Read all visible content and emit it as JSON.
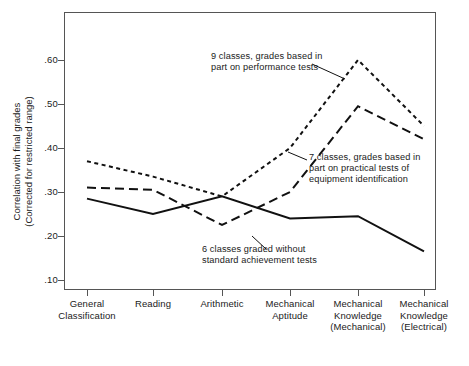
{
  "chart_data": {
    "type": "line",
    "title": "",
    "xlabel": "",
    "ylabel": "Correlation with final grades\n(Corrected for restricted range)",
    "ylabel_line1": "Correlation with final grades",
    "ylabel_line2": "(Corrected for restricted range)",
    "categories": [
      "General\nClassification",
      "Reading",
      "Arithmetic",
      "Mechanical\nAptitude",
      "Mechanical\nKnowledge\n(Mechanical)",
      "Mechanical\nKnowledge\n(Electrical)"
    ],
    "category_labels_flat": [
      "General Classification",
      "Reading",
      "Arithmetic",
      "Mechanical Aptitude",
      "Mechanical Knowledge (Mechanical)",
      "Mechanical Knowledge (Electrical)"
    ],
    "ylim": [
      0.06,
      0.655
    ],
    "yticks": [
      0.1,
      0.2,
      0.3,
      0.4,
      0.5,
      0.6
    ],
    "ytick_labels": [
      ".10",
      ".20",
      ".30",
      ".40",
      ".50",
      ".60"
    ],
    "grid": false,
    "legend": "annotations-inline",
    "series": [
      {
        "name": "9 classes, grades based in part on performance tests",
        "style": "dotted",
        "color": "#111111",
        "values": [
          0.37,
          0.335,
          0.29,
          0.4,
          0.6,
          0.45
        ]
      },
      {
        "name": "7 classes, grades based in part on practical tests of equipment identification",
        "style": "dashed",
        "color": "#111111",
        "values": [
          0.31,
          0.305,
          0.225,
          0.3,
          0.495,
          0.42
        ]
      },
      {
        "name": "6 classes graded without standard achievement tests",
        "style": "solid",
        "color": "#111111",
        "values": [
          0.285,
          0.25,
          0.29,
          0.24,
          0.245,
          0.165
        ]
      }
    ],
    "annotations": [
      {
        "id": "annotation-9-classes",
        "text": "9 classes, grades based in\npart on performance tests",
        "target_series": 0,
        "target_category_index": 4
      },
      {
        "id": "annotation-7-classes",
        "text": "7 classes, grades based in\npart on practical tests of\nequipment identification",
        "target_series": 1,
        "target_category_index": 4
      },
      {
        "id": "annotation-6-classes",
        "text": "6 classes graded without\nstandard achievement tests",
        "target_series": 2,
        "target_category_index": 3
      }
    ]
  }
}
